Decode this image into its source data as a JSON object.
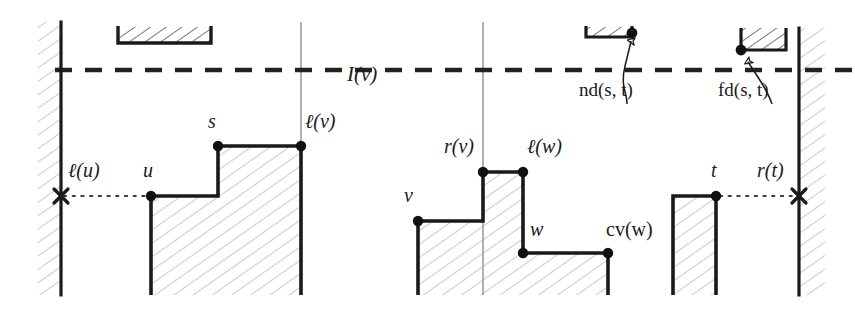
{
  "figure": {
    "colors": {
      "ink": "#1a1a1a",
      "thin_guide": "#9a9a9a",
      "hatch": "#b9b9b9",
      "background": "#ffffff"
    },
    "labels": [
      {
        "id": "l_u",
        "text": "ℓ(u)",
        "x": 68,
        "y": 172,
        "size": "lbl-md",
        "style": "italic"
      },
      {
        "id": "u",
        "text": "u",
        "x": 143,
        "y": 172,
        "size": "lbl-md",
        "style": "italic"
      },
      {
        "id": "s",
        "text": "s",
        "x": 208,
        "y": 123,
        "size": "lbl-md",
        "style": "italic"
      },
      {
        "id": "l_v",
        "text": "ℓ(v)",
        "x": 305,
        "y": 123,
        "size": "lbl-md",
        "style": "italic"
      },
      {
        "id": "I_v",
        "text": "I(v)",
        "x": 347,
        "y": 78,
        "size": "lbl-lg",
        "style": "italic"
      },
      {
        "id": "v",
        "text": "v",
        "x": 404,
        "y": 196,
        "size": "lbl-md",
        "style": "italic"
      },
      {
        "id": "r_v",
        "text": "r(v)",
        "x": 444,
        "y": 148,
        "size": "lbl-md",
        "style": "italic"
      },
      {
        "id": "l_w",
        "text": "ℓ(w)",
        "x": 527,
        "y": 148,
        "size": "lbl-md",
        "style": "italic"
      },
      {
        "id": "w",
        "text": "w",
        "x": 530,
        "y": 230,
        "size": "lbl-md",
        "style": "italic"
      },
      {
        "id": "cv_w",
        "text": "cv(w)",
        "x": 606,
        "y": 230,
        "size": "lbl-md",
        "style": "upright"
      },
      {
        "id": "t",
        "text": "t",
        "x": 710,
        "y": 172,
        "size": "lbl-md",
        "style": "italic"
      },
      {
        "id": "r_t",
        "text": "r(t)",
        "x": 757,
        "y": 172,
        "size": "lbl-md",
        "style": "italic"
      },
      {
        "id": "nd_st",
        "text": "nd(s, t)",
        "x": 579,
        "y": 90,
        "size": "lbl-sm",
        "style": "upright"
      },
      {
        "id": "fd_st",
        "text": "fd(s, t)",
        "x": 718,
        "y": 90,
        "size": "lbl-sm",
        "style": "upright"
      }
    ],
    "vertices": [
      {
        "id": "u",
        "x": 151,
        "y": 196
      },
      {
        "id": "s",
        "x": 218,
        "y": 146
      },
      {
        "id": "l_v",
        "x": 301,
        "y": 146
      },
      {
        "id": "v",
        "x": 418,
        "y": 221
      },
      {
        "id": "r_v",
        "x": 483,
        "y": 172
      },
      {
        "id": "l_w",
        "x": 523,
        "y": 172
      },
      {
        "id": "w",
        "x": 523,
        "y": 253
      },
      {
        "id": "cv_w",
        "x": 608,
        "y": 253
      },
      {
        "id": "t",
        "x": 716,
        "y": 196
      },
      {
        "id": "nd_tip",
        "x": 632,
        "y": 33
      },
      {
        "id": "fd_tip",
        "x": 741,
        "y": 50
      }
    ],
    "cross_marks": [
      {
        "id": "l_u_cross",
        "x": 61,
        "y": 196
      },
      {
        "id": "r_t_cross",
        "x": 799,
        "y": 196
      }
    ],
    "walls": [
      {
        "id": "left-wall",
        "x": 61,
        "y1": 22,
        "y2": 295,
        "hatch_side": "left"
      },
      {
        "id": "right-wall",
        "x": 799,
        "y1": 28,
        "y2": 295,
        "hatch_side": "right"
      }
    ],
    "guide_lines": [
      {
        "id": "guide-left",
        "x": 301,
        "y1": 22,
        "y2": 146
      },
      {
        "id": "guide-right",
        "x": 483,
        "y1": 22,
        "y2": 295
      }
    ],
    "interval_line": {
      "id": "I(v)",
      "y": 70,
      "x1": 55,
      "x2": 855
    },
    "dotted_links": [
      {
        "id": "l_u-link",
        "x1": 63,
        "x2": 149,
        "y": 196
      },
      {
        "id": "r_t-link",
        "x1": 718,
        "x2": 797,
        "y": 196
      }
    ]
  }
}
